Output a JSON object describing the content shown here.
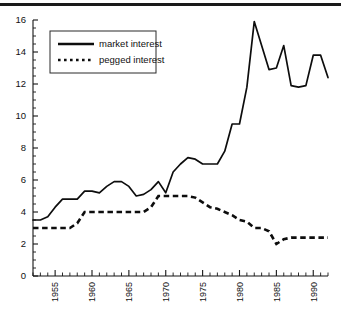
{
  "chart_data": {
    "type": "line",
    "title": "",
    "xlabel": "",
    "ylabel": "",
    "xlim": [
      1952,
      1992
    ],
    "ylim": [
      0,
      16
    ],
    "grid": false,
    "legend_position": "top-left",
    "y_ticks": [
      0,
      2,
      4,
      6,
      8,
      10,
      12,
      14,
      16
    ],
    "y_tick_labels": [
      "0",
      "2",
      "4",
      "6",
      "8",
      "10",
      "12",
      "14",
      "16"
    ],
    "y_minor_step": 0.5,
    "x_ticks": [
      1955,
      1960,
      1965,
      1970,
      1975,
      1980,
      1985,
      1990
    ],
    "x_tick_labels": [
      "1955",
      "1960",
      "1965",
      "1970",
      "1975",
      "1980",
      "1985",
      "1990"
    ],
    "x_minor_step": 1,
    "x": [
      1952,
      1953,
      1954,
      1955,
      1956,
      1957,
      1958,
      1959,
      1960,
      1961,
      1962,
      1963,
      1964,
      1965,
      1966,
      1967,
      1968,
      1969,
      1970,
      1971,
      1972,
      1973,
      1974,
      1975,
      1976,
      1977,
      1978,
      1979,
      1980,
      1981,
      1982,
      1983,
      1984,
      1985,
      1986,
      1987,
      1988,
      1989,
      1990,
      1991,
      1992
    ],
    "series": [
      {
        "name": "market interest",
        "style": "solid",
        "values": [
          3.5,
          3.5,
          3.7,
          4.3,
          4.8,
          4.8,
          4.8,
          5.3,
          5.3,
          5.2,
          5.6,
          5.9,
          5.9,
          5.6,
          5.0,
          5.1,
          5.4,
          5.9,
          5.2,
          6.5,
          7.0,
          7.4,
          7.3,
          7.0,
          7.0,
          7.0,
          7.8,
          9.5,
          9.5,
          11.8,
          15.9,
          14.4,
          12.9,
          13.0,
          14.4,
          11.9,
          11.8,
          11.9,
          13.8,
          13.8,
          12.4
        ]
      },
      {
        "name": "pegged interest",
        "style": "dotted",
        "values": [
          3.0,
          3.0,
          3.0,
          3.0,
          3.0,
          3.0,
          3.3,
          4.0,
          4.0,
          4.0,
          4.0,
          4.0,
          4.0,
          4.0,
          4.0,
          4.0,
          4.3,
          5.0,
          5.0,
          5.0,
          5.0,
          5.0,
          4.9,
          4.6,
          4.3,
          4.2,
          4.0,
          3.8,
          3.5,
          3.4,
          3.0,
          3.0,
          2.8,
          2.0,
          2.3,
          2.4,
          2.4,
          2.4,
          2.4,
          2.4,
          2.4
        ]
      }
    ]
  },
  "legend": {
    "entries": [
      {
        "label": "market interest",
        "style": "solid"
      },
      {
        "label": "pegged interest",
        "style": "dotted"
      }
    ]
  }
}
